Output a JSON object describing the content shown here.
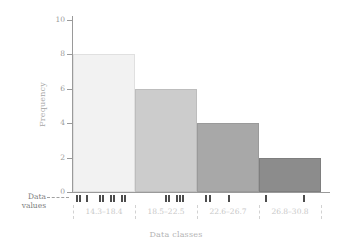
{
  "chart_data": {
    "type": "bar",
    "title": "",
    "xlabel": "Data classes",
    "ylabel": "Frequency",
    "categories": [
      "14.3–18.4",
      "18.5–22.5",
      "22.6–26.7",
      "26.8–30.8"
    ],
    "values": [
      8,
      6,
      4,
      2
    ],
    "ylim": [
      0,
      10
    ],
    "yticks": [
      0,
      2,
      4,
      6,
      8,
      10
    ],
    "ytick_labels": [
      "0",
      "2",
      "4",
      "6",
      "8",
      "10"
    ],
    "grid": false,
    "legend": null,
    "bar_colors": [
      "#f2f2f2",
      "#cccccc",
      "#a8a8a8",
      "#8c8c8c"
    ],
    "bar_edge_colors": [
      "#e0e0e0",
      "#bdbdbd",
      "#9a9a9a",
      "#7e7e7e"
    ],
    "annotations": {
      "data_values_label_line1": "Data",
      "data_values_label_line2": "values"
    },
    "rug_plot": {
      "name": "data values",
      "mark_color": "#4d4d4d",
      "positions_px": [
        76,
        79,
        86,
        99,
        102,
        110,
        113,
        121,
        124,
        165,
        168,
        176,
        179,
        182,
        205,
        209,
        228,
        265,
        303
      ],
      "count": 19
    },
    "axis_color": "#9a9a9a"
  }
}
